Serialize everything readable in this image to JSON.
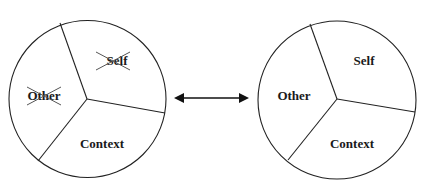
{
  "diagram": {
    "left_circle": {
      "segments": [
        {
          "label": "Self",
          "crossed_out": true
        },
        {
          "label": "Other",
          "crossed_out": true
        },
        {
          "label": "Context",
          "crossed_out": false
        }
      ]
    },
    "connector": {
      "type": "double-headed-arrow"
    },
    "right_circle": {
      "segments": [
        {
          "label": "Self",
          "crossed_out": false
        },
        {
          "label": "Other",
          "crossed_out": false
        },
        {
          "label": "Context",
          "crossed_out": false
        }
      ]
    }
  },
  "colors": {
    "stroke": "#222222",
    "text": "#1a1a1a",
    "background": "#ffffff"
  }
}
